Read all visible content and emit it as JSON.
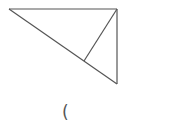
{
  "diagram": {
    "type": "geometry",
    "stroke_color": "#555555",
    "stroke_width": 1.2,
    "vertices": {
      "left": {
        "x": 9,
        "y": 9
      },
      "top_right": {
        "x": 117,
        "y": 9
      },
      "bottom": {
        "x": 117,
        "y": 84
      },
      "altitude_foot": {
        "x": 84,
        "y": 61
      }
    },
    "segments": [
      {
        "name": "top-edge",
        "from": "left",
        "to": "top_right"
      },
      {
        "name": "right-edge",
        "from": "top_right",
        "to": "bottom"
      },
      {
        "name": "hypotenuse",
        "from": "left",
        "to": "bottom"
      },
      {
        "name": "altitude",
        "from": "top_right",
        "to": "altitude_foot"
      }
    ]
  },
  "caption": {
    "text": "("
  }
}
